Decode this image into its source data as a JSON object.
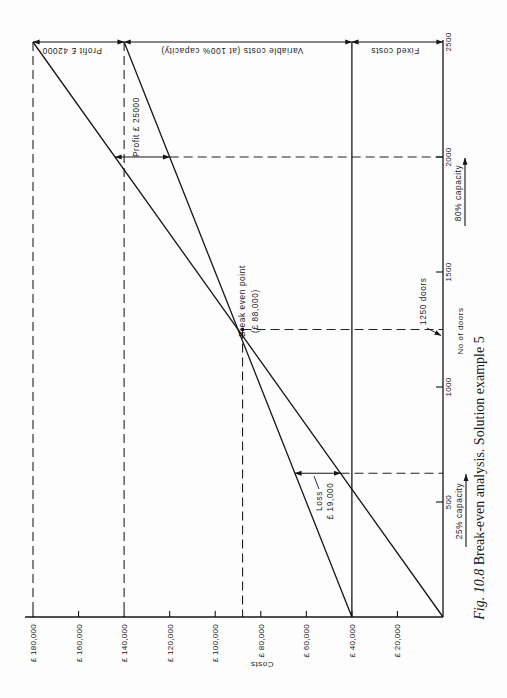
{
  "chart_data": {
    "type": "line",
    "orientation": "rotated 90 degrees counter-clockwise (costs axis along bottom, doors axis along right)",
    "title": "Fig. 10.8 Break-even analysis. Solution example 5",
    "caption_fig": "Fig. 10.8",
    "caption_text": " Break-even analysis. Solution example 5",
    "xlabel": "No of doors",
    "ylabel": "Costs",
    "xlim": [
      0,
      2500
    ],
    "ylim": [
      0,
      180000
    ],
    "grid": false,
    "x_ticks": [
      {
        "value": 500,
        "label": "500"
      },
      {
        "value": 1000,
        "label": "1000"
      },
      {
        "value": 1500,
        "label": "1500"
      },
      {
        "value": 2000,
        "label": "2000"
      },
      {
        "value": 2500,
        "label": "2500"
      }
    ],
    "y_ticks": [
      {
        "value": 20000,
        "label": "£ 20,000"
      },
      {
        "value": 40000,
        "label": "£ 40,000"
      },
      {
        "value": 60000,
        "label": "£ 60,000"
      },
      {
        "value": 80000,
        "label": "£ 80,000"
      },
      {
        "value": 100000,
        "label": "£ 100,000"
      },
      {
        "value": 120000,
        "label": "£ 120,000"
      },
      {
        "value": 140000,
        "label": "£ 140,000"
      },
      {
        "value": 160000,
        "label": "£ 160,000"
      },
      {
        "value": 180000,
        "label": "£ 180,000"
      }
    ],
    "series": [
      {
        "name": "Sales revenue",
        "x": [
          0,
          2500
        ],
        "y": [
          0,
          180000
        ]
      },
      {
        "name": "Total costs",
        "x": [
          0,
          2500
        ],
        "y": [
          40000,
          140000
        ]
      },
      {
        "name": "Fixed costs",
        "x": [
          0,
          2500
        ],
        "y": [
          40000,
          40000
        ]
      }
    ],
    "break_even": {
      "doors": 1250,
      "cost": 88000
    },
    "guides": {
      "costs": [
        {
          "value": 180000,
          "from_doors": 2500
        },
        {
          "value": 140000,
          "from_doors": 2500
        },
        {
          "value": 88000,
          "from_doors": 1250
        }
      ],
      "doors": [
        {
          "value": 2000,
          "from_cost": 120000
        },
        {
          "value": 1250,
          "from_cost": 88000
        },
        {
          "value": 625,
          "from_cost": 45000
        }
      ]
    },
    "dimensions": [
      {
        "id": "profit-at-2500",
        "doors": 2500,
        "from": 180000,
        "to": 140000
      },
      {
        "id": "variable-costs-at-2500",
        "doors": 2500,
        "from": 140000,
        "to": 40000
      },
      {
        "id": "fixed-costs-at-2500",
        "doors": 2500,
        "from": 40000,
        "to": 0
      },
      {
        "id": "profit-at-2000",
        "doors": 2000,
        "from": 144000,
        "to": 120000
      },
      {
        "id": "loss-at-625",
        "doors": 625,
        "from": 65000,
        "to": 45000
      }
    ],
    "capacity_markers": [
      {
        "id": "capacity-80",
        "doors": 2000
      },
      {
        "id": "capacity-25",
        "doors": 625
      }
    ],
    "annotations": {
      "profit_2500": "Profit £ 42000",
      "variable_costs": "Variable costs  (at 100% capacity)",
      "fixed_costs": "Fixed costs",
      "profit_2000": "Profit £ 25000",
      "break_even_label": "Break even point",
      "break_even_value": "(£ 88,000)",
      "loss_label": "Loss",
      "loss_value": "£ 19,000",
      "doors_1250": "1250 doors",
      "capacity_80": "80% capacity",
      "capacity_25": "25% capacity"
    }
  }
}
